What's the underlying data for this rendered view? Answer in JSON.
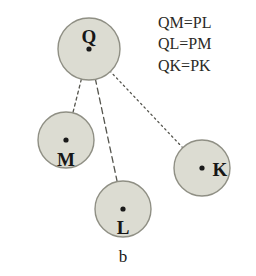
{
  "figure": {
    "caption": "b",
    "background_color": "#ffffff",
    "circle_fill_color": "#dcdcd2",
    "circle_stroke_color": "#8f8f84",
    "line_color": "#55554e",
    "label_color": "#171717"
  },
  "legend": {
    "lines": [
      {
        "text": "QM=PL"
      },
      {
        "text": "QL=PM"
      },
      {
        "text": "QK=PK"
      }
    ]
  },
  "nodes": [
    {
      "id": "Q",
      "label": "Q",
      "cx": 89,
      "cy": 49,
      "r": 31,
      "label_x": 89,
      "label_y": 43,
      "dot_r": 2.6
    },
    {
      "id": "M",
      "label": "M",
      "cx": 66,
      "cy": 140,
      "r": 28,
      "label_x": 66,
      "label_y": 166,
      "dot_r": 2.6
    },
    {
      "id": "L",
      "label": "L",
      "cx": 123,
      "cy": 209,
      "r": 28,
      "label_x": 123,
      "label_y": 234,
      "dot_r": 2.6
    },
    {
      "id": "K",
      "label": "K",
      "cx": 202,
      "cy": 168,
      "r": 28,
      "label_x": 220,
      "label_y": 176,
      "dot_r": 2.6
    }
  ],
  "edges": [
    {
      "id": "QM",
      "from": "Q",
      "to": "M",
      "style": "dashed-fine",
      "x1": 89,
      "y1": 49,
      "x2": 66,
      "y2": 140
    },
    {
      "id": "QL",
      "from": "Q",
      "to": "L",
      "style": "dashed-long",
      "x1": 89,
      "y1": 49,
      "x2": 123,
      "y2": 209
    },
    {
      "id": "QK",
      "from": "Q",
      "to": "K",
      "style": "dotted",
      "x1": 89,
      "y1": 49,
      "x2": 202,
      "y2": 168
    }
  ],
  "caption": {
    "text": "b",
    "x": 123,
    "y": 262
  }
}
